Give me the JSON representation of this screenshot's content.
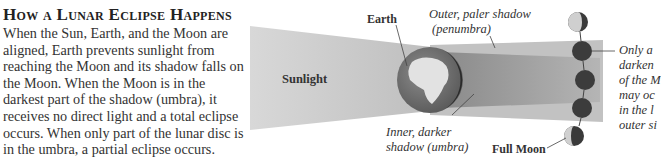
{
  "title": "How a Lunar Eclipse Happens",
  "body": "When the Sun, Earth, and the Moon are aligned, Earth prevents sunlight from reaching the Moon and its shadow falls on the Moon. When the Moon is in the darkest part of the shadow (umbra), it receives no direct light and a total eclipse occurs. When only part of the lunar disc is in the umbra, a partial eclipse occurs.",
  "labels": {
    "sunlight": "Sunlight",
    "earth": "Earth",
    "penumbra_line1": "Outer, paler shadow",
    "penumbra_line2": "(penumbra)",
    "umbra_line1": "Inner, darker",
    "umbra_line2": "shadow (umbra)",
    "full_moon": "Full Moon",
    "side_note_lines": [
      "Only a",
      "darken",
      "of the M",
      "may oc",
      "in the l",
      "outer si"
    ]
  },
  "colors": {
    "sunlight_beam": "#c4c4c4",
    "earth_ocean": "#777777",
    "earth_land": "#e0e0e0",
    "moon_dark": "#3a3a3a",
    "penumbra": "#b8b8b8"
  }
}
